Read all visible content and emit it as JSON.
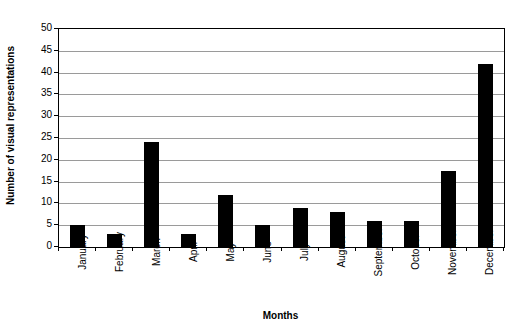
{
  "chart_data": {
    "type": "bar",
    "title": "",
    "xlabel": "Months",
    "ylabel": "Number of visual representations",
    "categories": [
      "January",
      "February",
      "March",
      "April",
      "May",
      "June",
      "July",
      "August",
      "September",
      "October",
      "November",
      "December"
    ],
    "values": [
      5,
      3,
      24,
      3,
      12,
      5,
      9,
      8,
      6,
      6,
      17.5,
      42
    ],
    "ylim": [
      0,
      50
    ],
    "yticks": [
      0,
      5,
      10,
      15,
      20,
      25,
      30,
      35,
      40,
      45,
      50
    ],
    "ytick_labels": [
      "0",
      "5",
      "10",
      "15",
      "20",
      "25",
      "30",
      "35",
      "40",
      "45",
      "50"
    ],
    "grid": "horizontal",
    "legend": "none",
    "bar_color": "#000000",
    "gridline_color": "#9a9a9a",
    "axis_color": "#000000",
    "background": "#ffffff"
  }
}
